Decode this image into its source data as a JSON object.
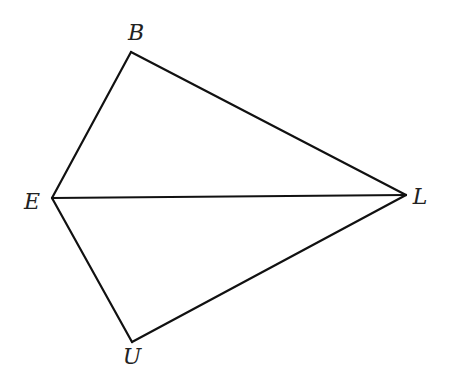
{
  "diagram": {
    "type": "geometry",
    "points": [
      {
        "id": "B",
        "label": "B",
        "x": 131,
        "y": 52,
        "label_x": 136,
        "label_y": 40
      },
      {
        "id": "E",
        "label": "E",
        "x": 52,
        "y": 198,
        "label_x": 32,
        "label_y": 209
      },
      {
        "id": "L",
        "label": "L",
        "x": 406,
        "y": 195,
        "label_x": 420,
        "label_y": 204
      },
      {
        "id": "U",
        "label": "U",
        "x": 132,
        "y": 342,
        "label_x": 132,
        "label_y": 364
      }
    ],
    "segments": [
      {
        "from": "B",
        "to": "L"
      },
      {
        "from": "B",
        "to": "E"
      },
      {
        "from": "E",
        "to": "L"
      },
      {
        "from": "E",
        "to": "U"
      },
      {
        "from": "U",
        "to": "L"
      }
    ],
    "stroke_color": "#111111",
    "background": "#ffffff"
  }
}
